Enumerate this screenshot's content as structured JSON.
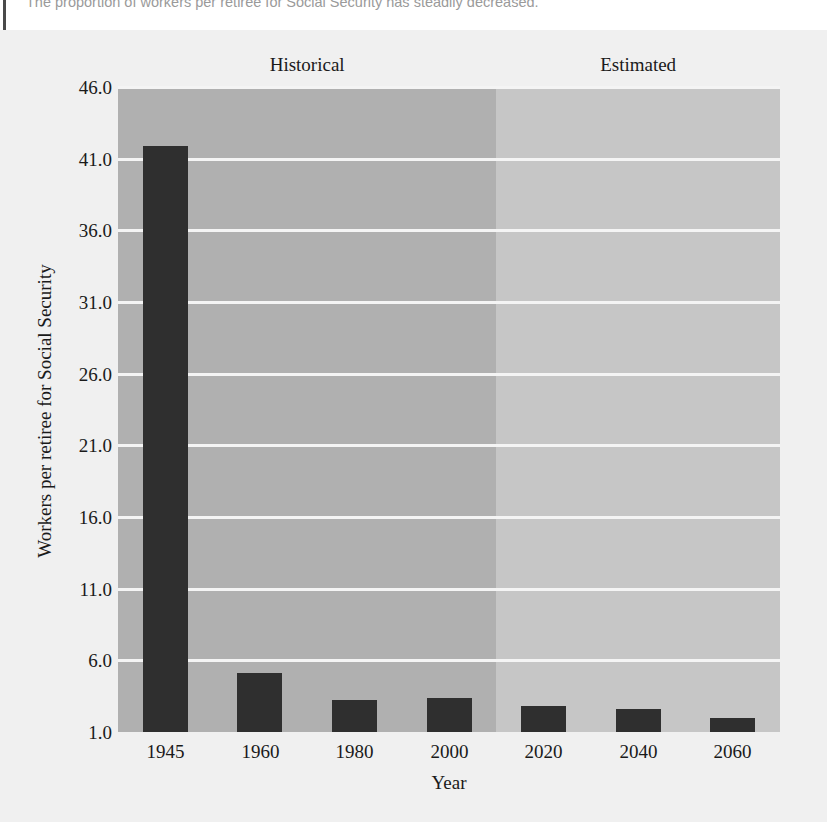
{
  "page": {
    "caption": "The proportion of workers per retiree for Social Security has steadily decreased."
  },
  "chart_data": {
    "type": "bar",
    "title": "",
    "xlabel": "Year",
    "ylabel": "Workers per retiree for Social Security",
    "categories": [
      "1945",
      "1960",
      "1980",
      "2000",
      "2020",
      "2040",
      "2060"
    ],
    "values": [
      41.9,
      5.1,
      3.2,
      3.4,
      2.8,
      2.6,
      2.0
    ],
    "ylim": [
      1.0,
      46.0
    ],
    "yticks": [
      "46.0",
      "41.0",
      "36.0",
      "31.0",
      "26.0",
      "21.0",
      "16.0",
      "11.0",
      "6.0",
      "1.0"
    ],
    "ytick_values": [
      46.0,
      41.0,
      36.0,
      31.0,
      26.0,
      21.0,
      16.0,
      11.0,
      6.0,
      1.0
    ],
    "grid": true,
    "legend_position": "none",
    "bands": [
      {
        "label": "Historical",
        "start_index": 0,
        "end_index": 3,
        "color": "#b0b0b0"
      },
      {
        "label": "Estimated",
        "start_index": 4,
        "end_index": 6,
        "color": "#c6c6c6"
      }
    ],
    "bar_color": "#2f2f2f",
    "gridline_color": "#f4f4f4",
    "background_color": "#f0f0f0"
  }
}
